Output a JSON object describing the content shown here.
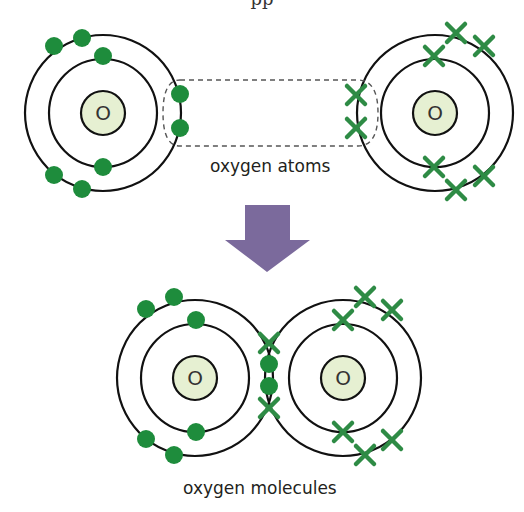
{
  "page": {
    "top_fragment": "pp",
    "colors": {
      "shell": "#111111",
      "nucleus_fill": "#e6f0d2",
      "electron": "#1e8c3c",
      "arrow": "#7b6a9c",
      "dash": "#555555"
    }
  },
  "top_section": {
    "caption": "oxygen atoms",
    "atoms": [
      {
        "id": "left",
        "symbol": "O",
        "electron_style": "dot",
        "inner_shell_electrons": 2,
        "outer_shell_electrons": 6
      },
      {
        "id": "right",
        "symbol": "O",
        "electron_style": "cross",
        "inner_shell_electrons": 2,
        "outer_shell_electrons": 6
      }
    ],
    "highlight": "dashed box around bonding electrons"
  },
  "arrow": {
    "direction": "down"
  },
  "bottom_section": {
    "caption": "oxygen molecules",
    "atoms": [
      {
        "id": "left",
        "symbol": "O",
        "electron_style": "dot"
      },
      {
        "id": "right",
        "symbol": "O",
        "electron_style": "cross"
      }
    ],
    "shared_electrons": [
      "cross",
      "dot",
      "dot",
      "cross"
    ]
  }
}
